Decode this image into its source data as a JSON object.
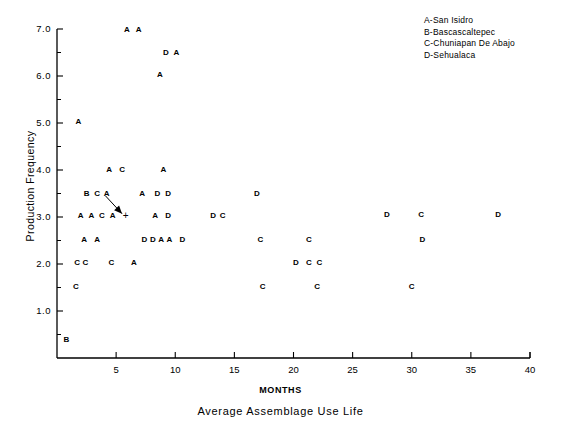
{
  "chart_data": {
    "type": "scatter",
    "title": "",
    "xlabel": "MONTHS",
    "xlabel_sub": "Average Assemblage Use Life",
    "ylabel": "Production Frequency",
    "xlim": [
      0,
      40
    ],
    "ylim": [
      0.3,
      7.0
    ],
    "grid": false,
    "x_ticks": [
      "5",
      "10",
      "15",
      "20",
      "25",
      "30",
      "35",
      "40"
    ],
    "x_tick_values": [
      5,
      10,
      15,
      20,
      25,
      30,
      35,
      40
    ],
    "y_ticks": [
      "1.0",
      "2.0",
      "3.0",
      "4.0",
      "5.0",
      "6.0",
      "7.0"
    ],
    "y_tick_values": [
      1.0,
      2.0,
      3.0,
      4.0,
      5.0,
      6.0,
      7.0
    ],
    "y_minor_ticks": [
      0.5,
      1.5,
      2.5,
      3.5,
      4.5,
      5.5,
      6.5
    ],
    "legend_position": "top-right",
    "legend": [
      {
        "symbol": "A",
        "label": "A-San Isidro"
      },
      {
        "symbol": "B",
        "label": "B-Bascascaltepec"
      },
      {
        "symbol": "C",
        "label": "C-Chuniapan De Abajo"
      },
      {
        "symbol": "D",
        "label": "D-Sehualaca"
      }
    ],
    "annotation": {
      "marker": "+",
      "marker_x": 5.8,
      "marker_y": 3.02,
      "arrow_from_x": 4.1,
      "arrow_from_y": 3.45,
      "arrow_to_x": 5.5,
      "arrow_to_y": 3.07
    },
    "points": [
      {
        "label": "A",
        "x": 5.9,
        "y": 6.97
      },
      {
        "label": "A",
        "x": 6.9,
        "y": 6.97
      },
      {
        "label": "D",
        "x": 9.2,
        "y": 6.5
      },
      {
        "label": "A",
        "x": 10.1,
        "y": 6.5
      },
      {
        "label": "A",
        "x": 8.7,
        "y": 6.02
      },
      {
        "label": "A",
        "x": 1.8,
        "y": 5.02
      },
      {
        "label": "A",
        "x": 4.4,
        "y": 4.0
      },
      {
        "label": "C",
        "x": 5.5,
        "y": 4.0
      },
      {
        "label": "A",
        "x": 9.0,
        "y": 4.0
      },
      {
        "label": "B",
        "x": 2.5,
        "y": 3.5
      },
      {
        "label": "C",
        "x": 3.4,
        "y": 3.5
      },
      {
        "label": "A",
        "x": 4.2,
        "y": 3.5
      },
      {
        "label": "A",
        "x": 7.2,
        "y": 3.5
      },
      {
        "label": "D",
        "x": 8.5,
        "y": 3.5
      },
      {
        "label": "D",
        "x": 9.4,
        "y": 3.5
      },
      {
        "label": "D",
        "x": 16.9,
        "y": 3.5
      },
      {
        "label": "D",
        "x": 27.9,
        "y": 3.05
      },
      {
        "label": "C",
        "x": 30.8,
        "y": 3.05
      },
      {
        "label": "D",
        "x": 37.3,
        "y": 3.05
      },
      {
        "label": "A",
        "x": 2.0,
        "y": 3.02
      },
      {
        "label": "A",
        "x": 2.9,
        "y": 3.02
      },
      {
        "label": "C",
        "x": 3.8,
        "y": 3.02
      },
      {
        "label": "A",
        "x": 4.7,
        "y": 3.02
      },
      {
        "label": "A",
        "x": 8.3,
        "y": 3.02
      },
      {
        "label": "D",
        "x": 9.4,
        "y": 3.02
      },
      {
        "label": "D",
        "x": 13.2,
        "y": 3.02
      },
      {
        "label": "C",
        "x": 14.0,
        "y": 3.02
      },
      {
        "label": "A",
        "x": 2.3,
        "y": 2.52
      },
      {
        "label": "A",
        "x": 3.4,
        "y": 2.52
      },
      {
        "label": "D",
        "x": 7.4,
        "y": 2.52
      },
      {
        "label": "D",
        "x": 8.1,
        "y": 2.52
      },
      {
        "label": "A",
        "x": 8.8,
        "y": 2.52
      },
      {
        "label": "A",
        "x": 9.5,
        "y": 2.52
      },
      {
        "label": "D",
        "x": 10.6,
        "y": 2.52
      },
      {
        "label": "C",
        "x": 17.2,
        "y": 2.52
      },
      {
        "label": "C",
        "x": 21.3,
        "y": 2.52
      },
      {
        "label": "D",
        "x": 30.9,
        "y": 2.52
      },
      {
        "label": "C",
        "x": 1.7,
        "y": 2.02
      },
      {
        "label": "C",
        "x": 2.4,
        "y": 2.02
      },
      {
        "label": "C",
        "x": 4.6,
        "y": 2.02
      },
      {
        "label": "A",
        "x": 6.5,
        "y": 2.02
      },
      {
        "label": "D",
        "x": 20.2,
        "y": 2.02
      },
      {
        "label": "C",
        "x": 21.3,
        "y": 2.02
      },
      {
        "label": "C",
        "x": 22.2,
        "y": 2.02
      },
      {
        "label": "C",
        "x": 1.6,
        "y": 1.52
      },
      {
        "label": "C",
        "x": 17.4,
        "y": 1.52
      },
      {
        "label": "C",
        "x": 22.0,
        "y": 1.52
      },
      {
        "label": "C",
        "x": 30.0,
        "y": 1.52
      },
      {
        "label": "B",
        "x": 0.8,
        "y": 0.38
      }
    ]
  }
}
